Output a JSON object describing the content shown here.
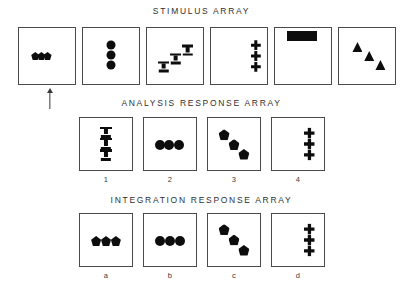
{
  "figure": {
    "background_color": "#ffffff",
    "ink_color": "#0d0d0d",
    "border_color": "#4a4a4a"
  },
  "rows": [
    {
      "id": "stimulus",
      "title": "STIMULUS  ARRAY",
      "title_top": 6,
      "panel_top": 27,
      "panel_size": 58,
      "panels": [
        {
          "name": "stimulus-panel-1",
          "left": 18,
          "label": "",
          "shapes": [
            {
              "type": "pent",
              "cx": 29,
              "cy": 50,
              "size": 8
            },
            {
              "type": "pent",
              "cx": 40,
              "cy": 50,
              "size": 8
            },
            {
              "type": "pent",
              "cx": 51,
              "cy": 50,
              "size": 8
            }
          ]
        },
        {
          "name": "stimulus-panel-2",
          "left": 82,
          "label": "",
          "shapes": [
            {
              "type": "circle",
              "cx": 50,
              "cy": 30,
              "size": 9
            },
            {
              "type": "circle",
              "cx": 50,
              "cy": 48,
              "size": 9
            },
            {
              "type": "circle",
              "cx": 50,
              "cy": 66,
              "size": 9
            }
          ]
        },
        {
          "name": "stimulus-panel-3",
          "left": 146,
          "label": "",
          "shapes": [
            {
              "type": "tee",
              "cx": 30,
              "cy": 69,
              "size": 11
            },
            {
              "type": "tee",
              "cx": 51,
              "cy": 55,
              "size": 11
            },
            {
              "type": "tee",
              "cx": 73,
              "cy": 40,
              "size": 11
            }
          ]
        },
        {
          "name": "stimulus-panel-4",
          "left": 210,
          "label": "",
          "shapes": [
            {
              "type": "plus",
              "cx": 80,
              "cy": 31,
              "size": 10
            },
            {
              "type": "plus",
              "cx": 80,
              "cy": 50,
              "size": 10
            },
            {
              "type": "plus",
              "cx": 80,
              "cy": 69,
              "size": 10
            }
          ]
        },
        {
          "name": "stimulus-panel-5",
          "left": 274,
          "label": "",
          "shapes": [
            {
              "type": "square",
              "cx": 30,
              "cy": 14,
              "size": 10
            },
            {
              "type": "square",
              "cx": 48,
              "cy": 14,
              "size": 10
            },
            {
              "type": "square",
              "cx": 66,
              "cy": 14,
              "size": 10
            }
          ]
        },
        {
          "name": "stimulus-panel-6",
          "left": 338,
          "label": "",
          "shapes": [
            {
              "type": "tri",
              "cx": 33,
              "cy": 34,
              "size": 10
            },
            {
              "type": "tri",
              "cx": 54,
              "cy": 50,
              "size": 10
            },
            {
              "type": "tri",
              "cx": 74,
              "cy": 66,
              "size": 10
            }
          ]
        }
      ]
    },
    {
      "id": "analysis",
      "title": "ANALYSIS  RESPONSE  ARRAY",
      "title_top": 98,
      "panel_top": 117,
      "panel_size": 54,
      "panels": [
        {
          "name": "analysis-panel-1",
          "left": 79,
          "label": "1",
          "shapes": [
            {
              "type": "tee",
              "cx": 50,
              "cy": 28,
              "size": 12
            },
            {
              "type": "tee",
              "cx": 50,
              "cy": 50,
              "size": 12
            },
            {
              "type": "tee",
              "cx": 50,
              "cy": 72,
              "size": 12
            }
          ]
        },
        {
          "name": "analysis-panel-2",
          "left": 143,
          "label": "2",
          "shapes": [
            {
              "type": "circle",
              "cx": 30,
              "cy": 52,
              "size": 10
            },
            {
              "type": "circle",
              "cx": 49,
              "cy": 52,
              "size": 10
            },
            {
              "type": "circle",
              "cx": 68,
              "cy": 52,
              "size": 10
            }
          ]
        },
        {
          "name": "analysis-panel-3",
          "left": 207,
          "label": "3",
          "shapes": [
            {
              "type": "pent",
              "cx": 31,
              "cy": 32,
              "size": 11
            },
            {
              "type": "pent",
              "cx": 50,
              "cy": 51,
              "size": 11
            },
            {
              "type": "pent",
              "cx": 69,
              "cy": 70,
              "size": 11
            }
          ]
        },
        {
          "name": "analysis-panel-4",
          "left": 271,
          "label": "4",
          "shapes": [
            {
              "type": "plus",
              "cx": 72,
              "cy": 29,
              "size": 11
            },
            {
              "type": "plus",
              "cx": 72,
              "cy": 50,
              "size": 11
            },
            {
              "type": "plus",
              "cx": 72,
              "cy": 71,
              "size": 11
            }
          ]
        }
      ]
    },
    {
      "id": "integration",
      "title": "INTEGRATION  RESPONSE  ARRAY",
      "title_top": 195,
      "panel_top": 213,
      "panel_size": 54,
      "panels": [
        {
          "name": "integration-panel-a",
          "left": 79,
          "label": "a",
          "shapes": [
            {
              "type": "pent",
              "cx": 31,
              "cy": 52,
              "size": 10
            },
            {
              "type": "pent",
              "cx": 50,
              "cy": 52,
              "size": 10
            },
            {
              "type": "pent",
              "cx": 69,
              "cy": 52,
              "size": 10
            }
          ]
        },
        {
          "name": "integration-panel-b",
          "left": 143,
          "label": "b",
          "shapes": [
            {
              "type": "circle",
              "cx": 31,
              "cy": 52,
              "size": 10
            },
            {
              "type": "circle",
              "cx": 50,
              "cy": 52,
              "size": 10
            },
            {
              "type": "circle",
              "cx": 69,
              "cy": 52,
              "size": 10
            }
          ]
        },
        {
          "name": "integration-panel-c",
          "left": 207,
          "label": "c",
          "shapes": [
            {
              "type": "pent",
              "cx": 31,
              "cy": 30,
              "size": 11
            },
            {
              "type": "pent",
              "cx": 50,
              "cy": 50,
              "size": 11
            },
            {
              "type": "pent",
              "cx": 69,
              "cy": 70,
              "size": 11
            }
          ]
        },
        {
          "name": "integration-panel-d",
          "left": 271,
          "label": "d",
          "shapes": [
            {
              "type": "plus",
              "cx": 72,
              "cy": 29,
              "size": 11
            },
            {
              "type": "plus",
              "cx": 72,
              "cy": 50,
              "size": 11
            },
            {
              "type": "plus",
              "cx": 72,
              "cy": 71,
              "size": 11
            }
          ]
        }
      ]
    }
  ],
  "pointer": {
    "name": "up-arrow-indicator",
    "left": 46,
    "top": 88,
    "height": 17,
    "target": "stimulus-panel-1"
  }
}
